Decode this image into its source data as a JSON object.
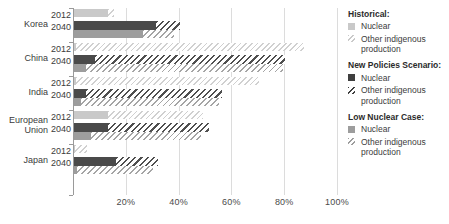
{
  "chart_data": {
    "type": "bar",
    "orientation": "horizontal",
    "title": "",
    "xlabel": "",
    "ylabel": "",
    "xlim": [
      0,
      100
    ],
    "xticks": [
      "0%",
      "20%",
      "40%",
      "60%",
      "80%",
      "100%"
    ],
    "xtick_values": [
      0,
      20,
      40,
      60,
      80,
      100
    ],
    "grid": true,
    "legend_position": "right",
    "stacked": true,
    "categories": [
      "Korea",
      "China",
      "India",
      "European Union",
      "Japan"
    ],
    "year_labels": [
      "2012",
      "2040"
    ],
    "series": [
      {
        "name": "Historical: Nuclear",
        "key": "hist_nuclear",
        "color": "#c9c9c9",
        "pattern": "solid"
      },
      {
        "name": "Historical: Other indigenous production",
        "key": "hist_other",
        "color": "#d0d0d0",
        "pattern": "hatch"
      },
      {
        "name": "New Policies Scenario: Nuclear",
        "key": "nps_nuclear",
        "color": "#4a4a4a",
        "pattern": "solid"
      },
      {
        "name": "New Policies Scenario: Other indigenous production",
        "key": "nps_other",
        "color": "#4f4f4f",
        "pattern": "hatch"
      },
      {
        "name": "Low Nuclear Case: Nuclear",
        "key": "low_nuclear",
        "color": "#9d9d9d",
        "pattern": "solid"
      },
      {
        "name": "Low Nuclear Case: Other indigenous production",
        "key": "low_other",
        "color": "#a5a5a5",
        "pattern": "hatch"
      }
    ],
    "rows": [
      {
        "category": "Korea",
        "year": "2012",
        "scenario": "Historical",
        "nuclear": 13.0,
        "other": 2.0,
        "total": 15.0
      },
      {
        "category": "Korea",
        "year": "2040",
        "scenario": "New Policies Scenario",
        "nuclear": 31.0,
        "other": 9.0,
        "total": 40.0
      },
      {
        "category": "Korea",
        "year": "2040",
        "scenario": "Low Nuclear Case",
        "nuclear": 26.0,
        "other": 12.0,
        "total": 38.0
      },
      {
        "category": "China",
        "year": "2012",
        "scenario": "Historical",
        "nuclear": 0.8,
        "other": 86.2,
        "total": 87.0
      },
      {
        "category": "China",
        "year": "2040",
        "scenario": "New Policies Scenario",
        "nuclear": 8.0,
        "other": 72.0,
        "total": 80.0
      },
      {
        "category": "China",
        "year": "2040",
        "scenario": "Low Nuclear Case",
        "nuclear": 4.5,
        "other": 74.5,
        "total": 79.0
      },
      {
        "category": "India",
        "year": "2012",
        "scenario": "Historical",
        "nuclear": 0.8,
        "other": 69.2,
        "total": 70.0
      },
      {
        "category": "India",
        "year": "2040",
        "scenario": "New Policies Scenario",
        "nuclear": 4.5,
        "other": 51.5,
        "total": 56.0
      },
      {
        "category": "India",
        "year": "2040",
        "scenario": "Low Nuclear Case",
        "nuclear": 2.5,
        "other": 52.5,
        "total": 55.0
      },
      {
        "category": "European Union",
        "year": "2012",
        "scenario": "Historical",
        "nuclear": 13.0,
        "other": 36.0,
        "total": 49.0
      },
      {
        "category": "European Union",
        "year": "2040",
        "scenario": "New Policies Scenario",
        "nuclear": 13.0,
        "other": 38.0,
        "total": 51.0
      },
      {
        "category": "European Union",
        "year": "2040",
        "scenario": "Low Nuclear Case",
        "nuclear": 6.5,
        "other": 41.5,
        "total": 48.0
      },
      {
        "category": "Japan",
        "year": "2012",
        "scenario": "Historical",
        "nuclear": 0.5,
        "other": 4.5,
        "total": 5.0
      },
      {
        "category": "Japan",
        "year": "2040",
        "scenario": "New Policies Scenario",
        "nuclear": 16.0,
        "other": 16.0,
        "total": 32.0
      },
      {
        "category": "Japan",
        "year": "2040",
        "scenario": "Low Nuclear Case",
        "nuclear": 1.0,
        "other": 29.0,
        "total": 30.0
      }
    ]
  },
  "axis": {
    "ticks": [
      {
        "label": "0%",
        "value": 0
      },
      {
        "label": "20%",
        "value": 20
      },
      {
        "label": "40%",
        "value": 40
      },
      {
        "label": "60%",
        "value": 60
      },
      {
        "label": "80%",
        "value": 80
      },
      {
        "label": "100%",
        "value": 100
      }
    ]
  },
  "legend": {
    "groups": [
      {
        "heading": "Historical:",
        "items": [
          {
            "label": "Nuclear",
            "swatch": "s-hist"
          },
          {
            "label": "Other indigenous production",
            "swatch": "h-hist"
          }
        ]
      },
      {
        "heading": "New Policies Scenario:",
        "items": [
          {
            "label": "Nuclear",
            "swatch": "s-nps"
          },
          {
            "label": "Other indigenous production",
            "swatch": "h-nps"
          }
        ]
      },
      {
        "heading": "Low Nuclear Case:",
        "items": [
          {
            "label": "Nuclear",
            "swatch": "s-low"
          },
          {
            "label": "Other indigenous production",
            "swatch": "h-low"
          }
        ]
      }
    ]
  }
}
